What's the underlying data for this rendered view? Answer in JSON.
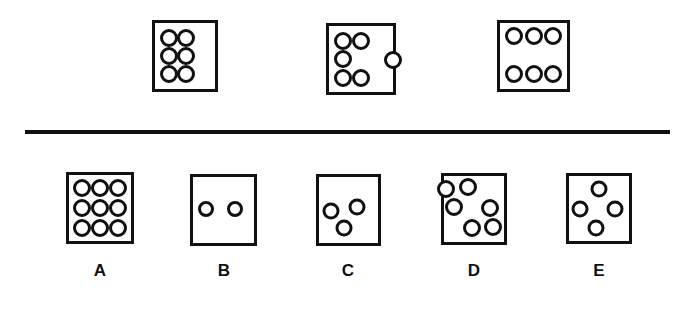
{
  "figure": {
    "type": "abstract-reasoning-puzzle",
    "colors": {
      "ink": "#111111",
      "paper": "#ffffff"
    },
    "divider": {
      "x": 25,
      "y": 130,
      "width": 645,
      "height": 4
    },
    "stimulus_row": {
      "name": "question-row",
      "boxes": [
        {
          "id": "q1",
          "label": "",
          "dot_count": 6,
          "box": {
            "x": 152,
            "y": 20,
            "w": 66,
            "h": 72
          },
          "dot_radius": 9,
          "dots": [
            {
              "cx": 24,
              "cy": 22
            },
            {
              "cx": 52,
              "cy": 22
            },
            {
              "cx": 24,
              "cy": 50
            },
            {
              "cx": 52,
              "cy": 50
            },
            {
              "cx": 24,
              "cy": 78
            },
            {
              "cx": 52,
              "cy": 78
            }
          ]
        },
        {
          "id": "q2",
          "label": "",
          "dot_count": 6,
          "box": {
            "x": 326,
            "y": 23,
            "w": 70,
            "h": 72
          },
          "dot_radius": 9,
          "dots": [
            {
              "cx": 22,
              "cy": 22
            },
            {
              "cx": 50,
              "cy": 22
            },
            {
              "cx": 22,
              "cy": 50
            },
            {
              "cx": 22,
              "cy": 79
            },
            {
              "cx": 50,
              "cy": 79
            },
            {
              "cx": 100,
              "cy": 52
            }
          ]
        },
        {
          "id": "q3",
          "label": "",
          "dot_count": 6,
          "box": {
            "x": 497,
            "y": 20,
            "w": 73,
            "h": 72
          },
          "dot_radius": 9,
          "dots": [
            {
              "cx": 21,
              "cy": 20
            },
            {
              "cx": 50,
              "cy": 20
            },
            {
              "cx": 79,
              "cy": 20
            },
            {
              "cx": 21,
              "cy": 78
            },
            {
              "cx": 50,
              "cy": 78
            },
            {
              "cx": 79,
              "cy": 78
            }
          ]
        }
      ]
    },
    "options_row": {
      "name": "answer-options-row",
      "label_y": 262,
      "options": [
        {
          "id": "A",
          "label": "A",
          "dot_count": 9,
          "box": {
            "x": 66,
            "y": 172,
            "w": 68,
            "h": 72
          },
          "label_x": 100,
          "dot_radius": 9,
          "dots": [
            {
              "cx": 21,
              "cy": 20
            },
            {
              "cx": 50,
              "cy": 20
            },
            {
              "cx": 79,
              "cy": 20
            },
            {
              "cx": 21,
              "cy": 50
            },
            {
              "cx": 50,
              "cy": 50
            },
            {
              "cx": 79,
              "cy": 50
            },
            {
              "cx": 21,
              "cy": 80
            },
            {
              "cx": 50,
              "cy": 80
            },
            {
              "cx": 79,
              "cy": 80
            }
          ]
        },
        {
          "id": "B",
          "label": "B",
          "dot_count": 2,
          "box": {
            "x": 190,
            "y": 174,
            "w": 67,
            "h": 72
          },
          "label_x": 224,
          "dot_radius": 8,
          "dots": [
            {
              "cx": 22,
              "cy": 48
            },
            {
              "cx": 69,
              "cy": 48
            }
          ]
        },
        {
          "id": "C",
          "label": "C",
          "dot_count": 3,
          "box": {
            "x": 316,
            "y": 174,
            "w": 65,
            "h": 72
          },
          "label_x": 348,
          "dot_radius": 8.5,
          "dots": [
            {
              "cx": 21,
              "cy": 52
            },
            {
              "cx": 65,
              "cy": 46
            },
            {
              "cx": 43,
              "cy": 78
            }
          ]
        },
        {
          "id": "D",
          "label": "D",
          "dot_count": 6,
          "box": {
            "x": 441,
            "y": 173,
            "w": 66,
            "h": 72
          },
          "label_x": 474,
          "dot_radius": 9,
          "dots": [
            {
              "cx": 4,
              "cy": 19
            },
            {
              "cx": 40,
              "cy": 17
            },
            {
              "cx": 17,
              "cy": 47
            },
            {
              "cx": 76,
              "cy": 49
            },
            {
              "cx": 46,
              "cy": 79
            },
            {
              "cx": 81,
              "cy": 78
            }
          ]
        },
        {
          "id": "E",
          "label": "E",
          "dot_count": 4,
          "box": {
            "x": 566,
            "y": 173,
            "w": 66,
            "h": 71
          },
          "label_x": 599,
          "dot_radius": 8.5,
          "dots": [
            {
              "cx": 50,
              "cy": 20
            },
            {
              "cx": 19,
              "cy": 50
            },
            {
              "cx": 76,
              "cy": 50
            },
            {
              "cx": 45,
              "cy": 80
            }
          ]
        }
      ]
    }
  },
  "chart_data": {
    "type": "table",
    "categories": [
      "Q1",
      "Q2",
      "Q3",
      "A",
      "B",
      "C",
      "D",
      "E"
    ],
    "values": [
      6,
      6,
      6,
      9,
      2,
      3,
      6,
      4
    ],
    "xlabel": "Figure",
    "ylabel": "Number of circles"
  }
}
